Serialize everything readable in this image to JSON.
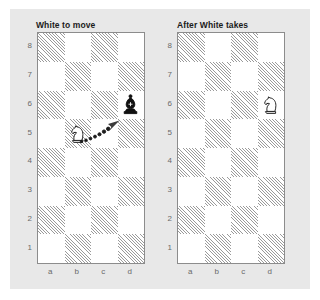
{
  "figure": {
    "background_color": "#e8e8e8",
    "board_border_color": "#8c8c8c",
    "dark_square_pattern": "diagonal-hatch",
    "light_square_color": "#ffffff",
    "piece_color": "#111111"
  },
  "boards": [
    {
      "id": "board-before",
      "title": "White to move",
      "files": [
        "a",
        "b",
        "c",
        "d"
      ],
      "ranks": [
        "8",
        "7",
        "6",
        "5",
        "4",
        "3",
        "2",
        "1"
      ],
      "pieces": [
        {
          "square": "b5",
          "piece": "knight",
          "color": "white",
          "icon": "white-knight-icon"
        },
        {
          "square": "d6",
          "piece": "bishop",
          "color": "black",
          "icon": "black-bishop-icon"
        }
      ],
      "move_arrow": {
        "from": "b5",
        "to": "d6",
        "style": "dotted-with-arrowhead",
        "icon": "capture-arrow-icon"
      }
    },
    {
      "id": "board-after",
      "title": "After White takes",
      "files": [
        "a",
        "b",
        "c",
        "d"
      ],
      "ranks": [
        "8",
        "7",
        "6",
        "5",
        "4",
        "3",
        "2",
        "1"
      ],
      "pieces": [
        {
          "square": "d6",
          "piece": "knight",
          "color": "white",
          "icon": "white-knight-icon"
        }
      ],
      "move_arrow": null
    }
  ]
}
